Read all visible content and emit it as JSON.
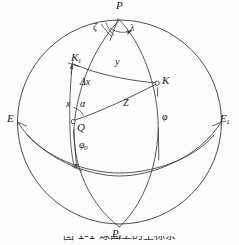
{
  "figure": {
    "kind": "sphere-spherical-coordinates-diagram",
    "caption": "图 1-1  球面上的坐标系",
    "caption_visible": "clipped",
    "background_color": "#fdfdfd",
    "stroke_color": "#3a3a3a"
  },
  "points": [
    {
      "id": "P",
      "label": "P",
      "sub": "",
      "x": 119,
      "y": 14,
      "marker": "none"
    },
    {
      "id": "P1",
      "label": "P",
      "sub": "1",
      "x": 119,
      "y": 228,
      "marker": "none"
    },
    {
      "id": "E",
      "label": "E",
      "sub": "",
      "x": 19,
      "y": 122,
      "marker": "none"
    },
    {
      "id": "E1",
      "label": "E",
      "sub": "1",
      "x": 219,
      "y": 122,
      "marker": "none"
    },
    {
      "id": "Q",
      "label": "Q",
      "sub": "",
      "x": 73,
      "y": 122,
      "marker": "open-circle"
    },
    {
      "id": "K",
      "label": "K",
      "sub": "",
      "x": 156,
      "y": 83,
      "marker": "open-circle"
    },
    {
      "id": "K1",
      "label": "K",
      "sub": "1",
      "x": 73,
      "y": 64,
      "marker": "tick"
    }
  ],
  "point_labels": [
    {
      "name": "point-label-P",
      "text": "P",
      "sub": "",
      "left": 116,
      "top": 1
    },
    {
      "name": "point-label-P1",
      "text": "P",
      "sub": "1",
      "left": 114,
      "top": 229
    },
    {
      "name": "point-label-E",
      "text": "E",
      "sub": "",
      "left": 8,
      "top": 114
    },
    {
      "name": "point-label-E1",
      "text": "E",
      "sub": "1",
      "left": 221,
      "top": 114
    },
    {
      "name": "point-label-Q",
      "text": "Q",
      "sub": "",
      "left": 78,
      "top": 122
    },
    {
      "name": "point-label-K",
      "text": "K",
      "sub": "",
      "left": 162,
      "top": 76
    },
    {
      "name": "point-label-K1",
      "text": "K",
      "sub": "1",
      "left": 72,
      "top": 53
    }
  ],
  "angle_labels": [
    {
      "name": "angle-label-zeta",
      "text": "ζ",
      "left": 95,
      "top": 23
    },
    {
      "name": "angle-label-lambda",
      "text": "λ",
      "left": 129,
      "top": 24
    },
    {
      "name": "angle-label-alpha",
      "text": "α",
      "left": 81,
      "top": 100
    },
    {
      "name": "angle-label-phi",
      "text": "φ",
      "left": 163,
      "top": 113
    },
    {
      "name": "angle-label-phi0",
      "text": "φ",
      "sub": "0",
      "left": 80,
      "top": 141
    }
  ],
  "segment_labels": [
    {
      "name": "segment-label-y",
      "text": "y",
      "left": 115,
      "top": 58
    },
    {
      "name": "segment-label-delta-x",
      "text": "Δx",
      "left": 81,
      "top": 78
    },
    {
      "name": "segment-label-x",
      "text": "x",
      "left": 67,
      "top": 100
    },
    {
      "name": "segment-label-Z",
      "text": "Z",
      "left": 123,
      "top": 99
    }
  ],
  "geometry": {
    "sphere": {
      "cx": 119.5,
      "cy": 122,
      "r": 102
    },
    "equator_label_left": "E",
    "equator_label_right": "E1",
    "pole_top": "P",
    "pole_bottom": "P1"
  },
  "legend": {
    "note": "Spherical triangle P-Q-K on a sphere with pole P, antipode P1, equator E-E1."
  }
}
